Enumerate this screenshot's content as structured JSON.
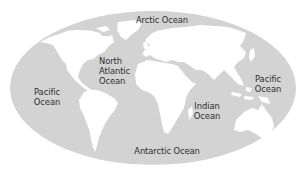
{
  "map": {
    "type": "world-oceans-map",
    "projection": "elliptical",
    "colors": {
      "ocean": "#d3d3d3",
      "land": "#ffffff",
      "background": "#ffffff",
      "label_text": "#2e2e2e"
    },
    "labels": {
      "arctic": {
        "lines": [
          "Arctic Ocean"
        ]
      },
      "north_atlantic": {
        "lines": [
          "North",
          "Atlantic",
          "Ocean"
        ]
      },
      "pacific_west": {
        "lines": [
          "Pacific",
          "Ocean"
        ]
      },
      "pacific_east": {
        "lines": [
          "Pacific",
          "Ocean"
        ]
      },
      "indian": {
        "lines": [
          "Indian",
          "Ocean"
        ]
      },
      "antarctic": {
        "lines": [
          "Antarctic Ocean"
        ]
      }
    },
    "continents": [
      "North America",
      "South America",
      "Europe",
      "Asia",
      "Africa",
      "Australia"
    ]
  }
}
